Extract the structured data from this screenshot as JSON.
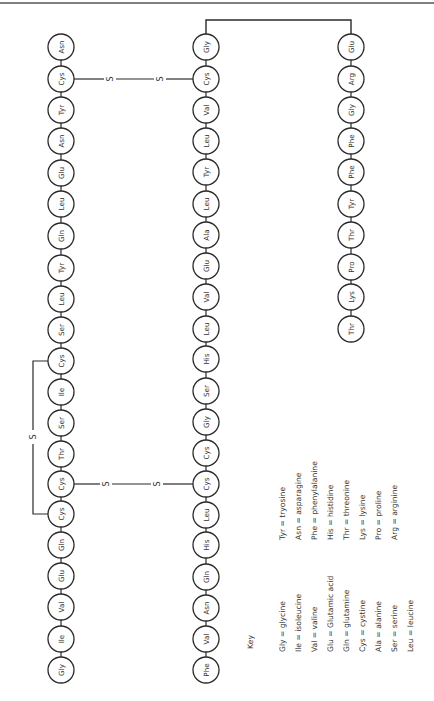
{
  "diagram": {
    "orientation": "rotated-90-ccw",
    "colors": {
      "stroke": "#2a2a2a",
      "text": "#333333",
      "background": "#ffffff",
      "rule": "#555555"
    },
    "circle_radius": 13,
    "chains": [
      {
        "id": "chain-a-left",
        "x": 61,
        "residues": [
          {
            "label": "Asn",
            "y": 47
          },
          {
            "label": "Cys",
            "y": 79
          },
          {
            "label": "Tyr",
            "y": 110
          },
          {
            "label": "Asn",
            "y": 141
          },
          {
            "label": "Glu",
            "y": 173
          },
          {
            "label": "Leu",
            "y": 204
          },
          {
            "label": "Gln",
            "y": 236
          },
          {
            "label": "Tyr",
            "y": 268
          },
          {
            "label": "Leu",
            "y": 299
          },
          {
            "label": "Ser",
            "y": 330
          },
          {
            "label": "Cys",
            "y": 361
          },
          {
            "label": "Ile",
            "y": 392
          },
          {
            "label": "Ser",
            "y": 423
          },
          {
            "label": "Thr",
            "y": 454
          },
          {
            "label": "Cys",
            "y": 484
          },
          {
            "label": "Cys",
            "y": 514
          },
          {
            "label": "Gln",
            "y": 545
          },
          {
            "label": "Glu",
            "y": 576
          },
          {
            "label": "Val",
            "y": 607
          },
          {
            "label": "Ile",
            "y": 639
          },
          {
            "label": "Gly",
            "y": 670
          }
        ]
      },
      {
        "id": "chain-b-middle",
        "x": 206,
        "residues": [
          {
            "label": "Gly",
            "y": 47
          },
          {
            "label": "Cys",
            "y": 79
          },
          {
            "label": "Val",
            "y": 110
          },
          {
            "label": "Leu",
            "y": 141
          },
          {
            "label": "Tyr",
            "y": 172
          },
          {
            "label": "Leu",
            "y": 204
          },
          {
            "label": "Ala",
            "y": 235
          },
          {
            "label": "Glu",
            "y": 266
          },
          {
            "label": "Val",
            "y": 297
          },
          {
            "label": "Leu",
            "y": 329
          },
          {
            "label": "His",
            "y": 359
          },
          {
            "label": "Ser",
            "y": 391
          },
          {
            "label": "Gly",
            "y": 422
          },
          {
            "label": "Cys",
            "y": 453
          },
          {
            "label": "Cys",
            "y": 484
          },
          {
            "label": "Leu",
            "y": 515
          },
          {
            "label": "His",
            "y": 545
          },
          {
            "label": "Gln",
            "y": 577
          },
          {
            "label": "Asn",
            "y": 608
          },
          {
            "label": "Val",
            "y": 639
          },
          {
            "label": "Phe",
            "y": 670
          }
        ]
      },
      {
        "id": "chain-b-right",
        "x": 351,
        "residues": [
          {
            "label": "Glu",
            "y": 47
          },
          {
            "label": "Arg",
            "y": 79
          },
          {
            "label": "Gly",
            "y": 110
          },
          {
            "label": "Phe",
            "y": 141
          },
          {
            "label": "Phe",
            "y": 172
          },
          {
            "label": "Tyr",
            "y": 204
          },
          {
            "label": "Thr",
            "y": 235
          },
          {
            "label": "Pro",
            "y": 267
          },
          {
            "label": "Lys",
            "y": 297
          },
          {
            "label": "Thr",
            "y": 329
          }
        ]
      }
    ],
    "disulfide_bonds": [
      {
        "id": "bond-top",
        "y": 79,
        "x1": 74,
        "x2": 193,
        "s_labels": [
          {
            "text": "S",
            "x": 110
          },
          {
            "text": "S",
            "x": 160
          }
        ]
      },
      {
        "id": "bond-bottom",
        "y": 484,
        "x1": 74,
        "x2": 193,
        "s_labels": [
          {
            "text": "S",
            "x": 106
          },
          {
            "text": "S",
            "x": 157
          }
        ]
      }
    ],
    "intrachain_bond": {
      "x": 33,
      "y1": 361,
      "y2": 514,
      "s_label": {
        "text": "S",
        "y": 437
      }
    },
    "connector": {
      "y": 20,
      "x1": 206,
      "x2": 351
    },
    "key": {
      "title": "Key",
      "title_pos": {
        "x": 250,
        "y": 642
      },
      "column1": {
        "bottom_y": 652,
        "entries": [
          {
            "text": "Gly = glycine",
            "x": 282
          },
          {
            "text": "Ile = isoleucine",
            "x": 298
          },
          {
            "text": "Val = valine",
            "x": 314
          },
          {
            "text": "Glu = Glutamic acid",
            "x": 330
          },
          {
            "text": "Gln = glutamine",
            "x": 346
          },
          {
            "text": "Cys = cystine",
            "x": 362
          },
          {
            "text": "Ala = alanine",
            "x": 378
          },
          {
            "text": "Ser = serine",
            "x": 394
          },
          {
            "text": "Leu = leucine",
            "x": 410
          }
        ]
      },
      "column2": {
        "bottom_y": 540,
        "entries": [
          {
            "text": "Tyr = tryosine",
            "x": 282
          },
          {
            "text": "Asn = asparagine",
            "x": 298
          },
          {
            "text": "Phe = phenylalanine",
            "x": 314
          },
          {
            "text": "His = histidine",
            "x": 330
          },
          {
            "text": "Thr = threonine",
            "x": 346
          },
          {
            "text": "Lys = lysine",
            "x": 362
          },
          {
            "text": "Pro = proline",
            "x": 378
          },
          {
            "text": "Arg = arginine",
            "x": 394
          }
        ]
      }
    }
  }
}
